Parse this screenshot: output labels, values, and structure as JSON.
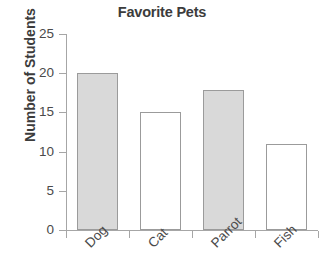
{
  "chart_data": {
    "type": "bar",
    "title": "Favorite Pets",
    "xlabel": "",
    "ylabel": "Number of Students",
    "categories": [
      "Dog",
      "Cat",
      "Parrot",
      "Fish"
    ],
    "values": [
      20,
      15,
      17.8,
      11
    ],
    "ylim": [
      0,
      25
    ],
    "yticks": [
      0,
      5,
      10,
      15,
      20,
      25
    ],
    "ytick_labels": [
      "0",
      "5",
      "10",
      "15",
      "20",
      "25"
    ],
    "grid": false,
    "legend": "none",
    "bar_styles": [
      "filled",
      "hollow",
      "filled",
      "hollow"
    ],
    "colors": {
      "bar_fill": "#d9d9d9",
      "bar_empty": "#ffffff",
      "bar_border": "#9b9b9b",
      "axis": "#a6a6a6",
      "text": "#3c3c3c",
      "tick_text": "#4a4a4a",
      "background": "#ffffff"
    }
  }
}
